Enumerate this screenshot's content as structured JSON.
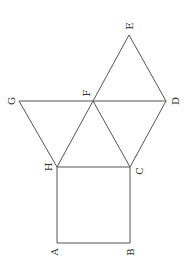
{
  "diagram": {
    "points": {
      "A": {
        "x": 57,
        "y": 243
      },
      "B": {
        "x": 130,
        "y": 243
      },
      "C": {
        "x": 130,
        "y": 167
      },
      "H": {
        "x": 57,
        "y": 167
      },
      "F": {
        "x": 93,
        "y": 101
      },
      "G": {
        "x": 19,
        "y": 101
      },
      "D": {
        "x": 166,
        "y": 101
      },
      "E": {
        "x": 129,
        "y": 35
      }
    },
    "labels": {
      "A": "A",
      "B": "B",
      "C": "C",
      "D": "D",
      "E": "E",
      "F": "F",
      "G": "G",
      "H": "H"
    },
    "line_color": "#555555"
  }
}
